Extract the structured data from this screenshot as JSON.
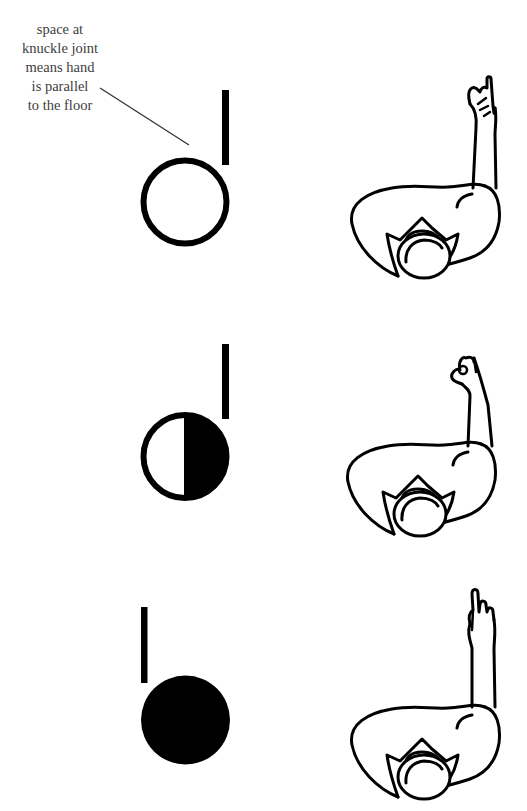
{
  "annotation": {
    "lines": [
      "space at",
      "knuckle joint",
      "means hand",
      "is parallel",
      "to the floor"
    ]
  },
  "rows": [
    {
      "symbol": "open-circle",
      "stem_side": "right",
      "description": "palm facing down, hand parallel to floor",
      "figure": "index finger up, other fingers curled forward"
    },
    {
      "symbol": "half-filled-circle",
      "stem_side": "right",
      "description": "right half filled",
      "figure": "index finger up, hand turned sideways"
    },
    {
      "symbol": "filled-circle",
      "stem_side": "left",
      "description": "fully filled circle",
      "figure": "index finger up, fingers visible from back"
    }
  ],
  "colors": {
    "ink": "#000000",
    "text": "#3d3d3d",
    "background": "#ffffff"
  }
}
